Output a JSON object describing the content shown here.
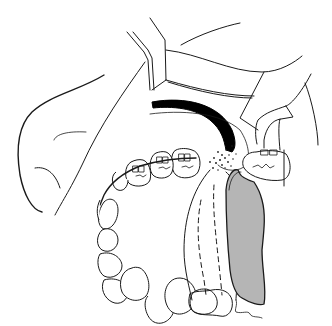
{
  "figure": {
    "title": "",
    "colors": {
      "line": "#1a1a1a",
      "background": "#ffffff",
      "appliance_fill": "#b5b5b5",
      "arch_band": "#000000"
    },
    "parts": [
      {
        "name": "retracted-cheek"
      },
      {
        "name": "retractor-instrument"
      },
      {
        "name": "upper-lip-fold"
      },
      {
        "name": "black-arch-band"
      },
      {
        "name": "stippled-gingiva"
      },
      {
        "name": "bracketed-teeth"
      },
      {
        "name": "arch-wire"
      },
      {
        "name": "lower-teeth-row"
      },
      {
        "name": "dashed-palatal-strip"
      },
      {
        "name": "grey-appliance"
      },
      {
        "name": "right-molar-bracket"
      }
    ]
  }
}
